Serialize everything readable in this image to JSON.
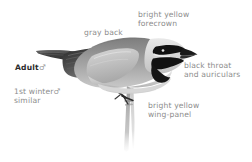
{
  "plate": {
    "subject": "golden-winged-warbler",
    "background_color": "#ffffff",
    "label_color": "#8c8c8c",
    "emphasis_color": "#2b2b2b"
  },
  "labels": {
    "forecrown": "bright yellow\nforecrown",
    "gray_back": "gray back",
    "black_throat": "black throat\nand auriculars",
    "wing_panel": "bright yellow\nwing-panel",
    "adult_text": "Adult",
    "adult_symbol": "♂",
    "first_winter_text": "1st winter",
    "first_winter_symbol": "♂",
    "first_winter_note": "similar"
  },
  "illustration": {
    "name": "perched-warbler",
    "parts": [
      "tail",
      "wing",
      "back",
      "crown",
      "black-eye-stripe",
      "black-throat",
      "bill",
      "breast",
      "belly",
      "legs",
      "branch"
    ],
    "colors": {
      "tail_dark": "#4a4a4a",
      "wing_dark": "#3c3c3c",
      "back_gray": "#9b9b9b",
      "crown_pale": "#d9d9d9",
      "black_mask": "#141414",
      "underparts": "#cfcfcf",
      "branch": "#9e9e9e"
    }
  }
}
